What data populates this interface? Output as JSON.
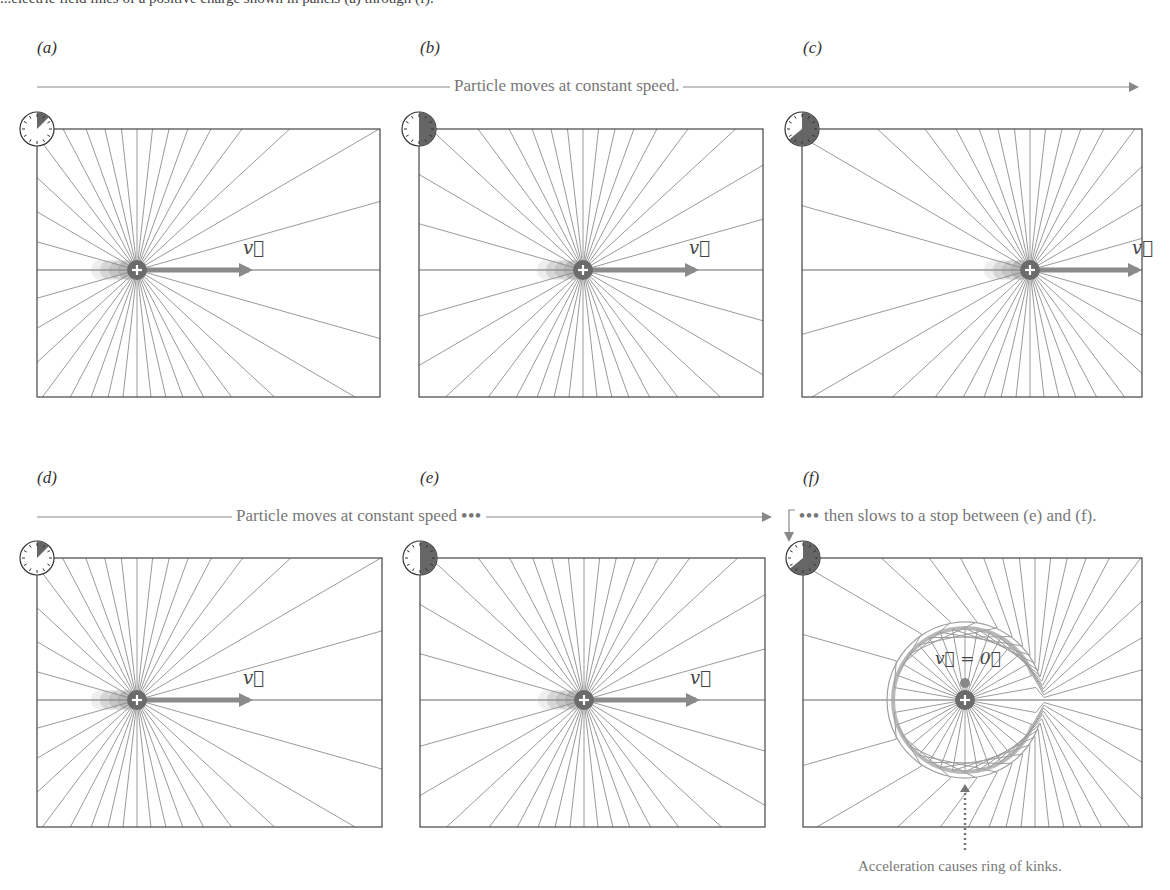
{
  "caption_fragment": "...electric field lines of a positive charge shown in panels (a) through (f).",
  "panels": [
    {
      "id": "a",
      "label": "(a)",
      "label_x": 37,
      "label_y": 50,
      "box": [
        37,
        129,
        380,
        397
      ],
      "charge": [
        137,
        270
      ],
      "velocity_label": "v⃗",
      "state": "moving",
      "clock_fraction": 0.125,
      "gamma": 1.6
    },
    {
      "id": "b",
      "label": "(b)",
      "label_x": 420,
      "label_y": 50,
      "box": [
        419,
        129,
        763,
        397
      ],
      "charge": [
        583,
        270
      ],
      "velocity_label": "v⃗",
      "state": "moving",
      "clock_fraction": 0.5,
      "gamma": 1.6
    },
    {
      "id": "c",
      "label": "(c)",
      "label_x": 803,
      "label_y": 50,
      "box": [
        802,
        129,
        1142,
        397
      ],
      "charge": [
        1030,
        270
      ],
      "velocity_label": "v⃗",
      "state": "moving",
      "clock_fraction": 0.64,
      "gamma": 1.6
    },
    {
      "id": "d",
      "label": "(d)",
      "label_x": 37,
      "label_y": 480,
      "box": [
        37,
        558,
        382,
        827
      ],
      "charge": [
        137,
        700
      ],
      "velocity_label": "v⃗",
      "state": "moving",
      "clock_fraction": 0.125,
      "gamma": 1.6
    },
    {
      "id": "e",
      "label": "(e)",
      "label_x": 420,
      "label_y": 480,
      "box": [
        420,
        558,
        765,
        827
      ],
      "charge": [
        584,
        700
      ],
      "velocity_label": "v⃗",
      "state": "moving",
      "clock_fraction": 0.5,
      "gamma": 1.6
    },
    {
      "id": "f",
      "label": "(f)",
      "label_x": 803,
      "label_y": 480,
      "box": [
        803,
        558,
        1142,
        827
      ],
      "charge": [
        965,
        700
      ],
      "velocity_label": "v⃗ = 0⃗",
      "state": "stopped",
      "clock_fraction": 0.64,
      "gamma": 1.6,
      "ring_radius": 72,
      "old_charge": [
        1035,
        700
      ]
    }
  ],
  "flow_top": {
    "text": "Particle moves at constant speed.",
    "line_start": 37,
    "text_x": 450,
    "line_end": 1137,
    "y": 87
  },
  "flow_bottom_left": {
    "text": "Particle moves at constant speed",
    "dots": "•••",
    "line_start": 37,
    "text_x": 232,
    "line_end": 770,
    "y": 517
  },
  "flow_bottom_right": {
    "dots": "•••",
    "text": "then slows to a stop between (e) and (f).",
    "x": 795,
    "y": 517
  },
  "annotation": {
    "text": "Acceleration causes ring of kinks.",
    "x": 880,
    "y": 878,
    "arrow_x": 965,
    "arrow_y1": 850,
    "arrow_y2": 784
  },
  "colors": {
    "field_line": "#9a9a9a",
    "box": "#444444",
    "charge": "#6b6b6b",
    "arrow": "#8a8a8a",
    "clock_fill": "#666666",
    "text": "#777777",
    "ring": "#a0a0a0"
  },
  "field_line_count": 36
}
